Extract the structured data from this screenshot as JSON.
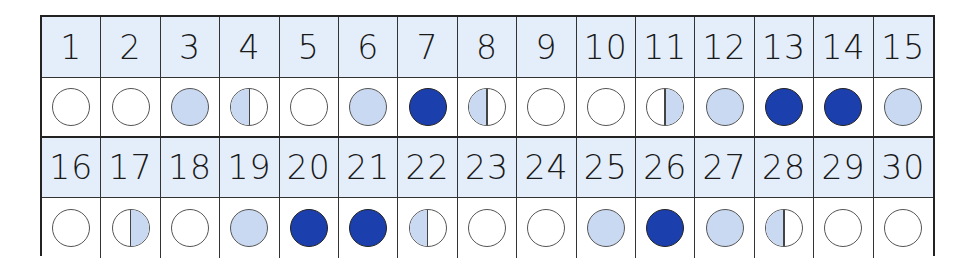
{
  "colors": {
    "header_bg": "#e4eefa",
    "light_fill": "#c9d9f2",
    "dark_fill": "#1c3fae",
    "outline": "#555555",
    "grid_line": "#222222"
  },
  "legend_states": {
    "empty": "unfilled circle",
    "light": "light blue filled circle",
    "dark": "dark blue filled circle",
    "half-left": "left half light blue",
    "half-right": "right half light blue"
  },
  "rows": [
    {
      "days": [
        {
          "day": "1",
          "state": "empty"
        },
        {
          "day": "2",
          "state": "empty"
        },
        {
          "day": "3",
          "state": "light"
        },
        {
          "day": "4",
          "state": "half-left"
        },
        {
          "day": "5",
          "state": "empty"
        },
        {
          "day": "6",
          "state": "light"
        },
        {
          "day": "7",
          "state": "dark"
        },
        {
          "day": "8",
          "state": "half-left"
        },
        {
          "day": "9",
          "state": "empty"
        },
        {
          "day": "10",
          "state": "empty"
        },
        {
          "day": "11",
          "state": "half-right"
        },
        {
          "day": "12",
          "state": "light"
        },
        {
          "day": "13",
          "state": "dark"
        },
        {
          "day": "14",
          "state": "dark"
        },
        {
          "day": "15",
          "state": "light"
        }
      ]
    },
    {
      "days": [
        {
          "day": "16",
          "state": "empty"
        },
        {
          "day": "17",
          "state": "half-right"
        },
        {
          "day": "18",
          "state": "empty"
        },
        {
          "day": "19",
          "state": "light"
        },
        {
          "day": "20",
          "state": "dark"
        },
        {
          "day": "21",
          "state": "dark"
        },
        {
          "day": "22",
          "state": "half-left"
        },
        {
          "day": "23",
          "state": "empty"
        },
        {
          "day": "24",
          "state": "empty"
        },
        {
          "day": "25",
          "state": "light"
        },
        {
          "day": "26",
          "state": "dark"
        },
        {
          "day": "27",
          "state": "light"
        },
        {
          "day": "28",
          "state": "half-left"
        },
        {
          "day": "29",
          "state": "empty"
        },
        {
          "day": "30",
          "state": "empty"
        }
      ]
    }
  ]
}
